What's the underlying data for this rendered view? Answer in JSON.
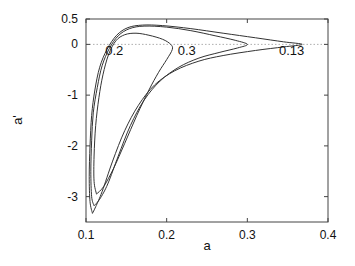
{
  "chart_data": {
    "type": "line",
    "title": "",
    "xlabel": "a",
    "ylabel": "a'",
    "xlim": [
      0.1,
      0.4
    ],
    "ylim": [
      -3.5,
      0.5
    ],
    "xticks": [
      0.1,
      0.2,
      0.3,
      0.4
    ],
    "xtick_labels": [
      "0.1",
      "0.2",
      "0.3",
      "0.4"
    ],
    "yticks": [
      0.5,
      0,
      -1,
      -2,
      -3
    ],
    "ytick_labels": [
      "0.5",
      "0",
      "-1",
      "-2",
      "-3"
    ],
    "grid": false,
    "reference_line": {
      "y": 0,
      "style": "dotted"
    },
    "legend": "none",
    "series": [
      {
        "name": "0.13",
        "label": "0.13",
        "label_at": [
          0.355,
          -0.12
        ],
        "closed": true,
        "points": [
          [
            0.108,
            -3.33
          ],
          [
            0.105,
            -3.1
          ],
          [
            0.104,
            -2.6
          ],
          [
            0.105,
            -2.0
          ],
          [
            0.107,
            -1.4
          ],
          [
            0.111,
            -0.9
          ],
          [
            0.117,
            -0.45
          ],
          [
            0.126,
            -0.1
          ],
          [
            0.138,
            0.18
          ],
          [
            0.152,
            0.33
          ],
          [
            0.17,
            0.38
          ],
          [
            0.195,
            0.37
          ],
          [
            0.23,
            0.31
          ],
          [
            0.27,
            0.22
          ],
          [
            0.31,
            0.13
          ],
          [
            0.345,
            0.05
          ],
          [
            0.368,
            0.0
          ],
          [
            0.345,
            -0.05
          ],
          [
            0.31,
            -0.12
          ],
          [
            0.27,
            -0.22
          ],
          [
            0.24,
            -0.33
          ],
          [
            0.21,
            -0.52
          ],
          [
            0.185,
            -0.8
          ],
          [
            0.165,
            -1.2
          ],
          [
            0.148,
            -1.7
          ],
          [
            0.133,
            -2.3
          ],
          [
            0.12,
            -2.9
          ],
          [
            0.112,
            -3.2
          ],
          [
            0.108,
            -3.33
          ]
        ]
      },
      {
        "name": "0.3",
        "label": "0.3",
        "label_at": [
          0.225,
          -0.12
        ],
        "closed": true,
        "points": [
          [
            0.11,
            -3.18
          ],
          [
            0.107,
            -3.0
          ],
          [
            0.106,
            -2.5
          ],
          [
            0.107,
            -1.9
          ],
          [
            0.109,
            -1.35
          ],
          [
            0.114,
            -0.85
          ],
          [
            0.12,
            -0.42
          ],
          [
            0.129,
            -0.08
          ],
          [
            0.14,
            0.17
          ],
          [
            0.154,
            0.31
          ],
          [
            0.172,
            0.36
          ],
          [
            0.2,
            0.34
          ],
          [
            0.23,
            0.27
          ],
          [
            0.26,
            0.17
          ],
          [
            0.285,
            0.08
          ],
          [
            0.3,
            0.0
          ],
          [
            0.288,
            -0.07
          ],
          [
            0.265,
            -0.16
          ],
          [
            0.24,
            -0.27
          ],
          [
            0.215,
            -0.45
          ],
          [
            0.192,
            -0.72
          ],
          [
            0.172,
            -1.1
          ],
          [
            0.155,
            -1.6
          ],
          [
            0.14,
            -2.2
          ],
          [
            0.127,
            -2.75
          ],
          [
            0.117,
            -3.05
          ],
          [
            0.11,
            -3.18
          ]
        ]
      },
      {
        "name": "0.2",
        "label": "0.2",
        "label_at": [
          0.135,
          -0.12
        ],
        "closed": true,
        "points": [
          [
            0.113,
            -2.95
          ],
          [
            0.11,
            -2.7
          ],
          [
            0.11,
            -2.2
          ],
          [
            0.112,
            -1.6
          ],
          [
            0.116,
            -1.05
          ],
          [
            0.121,
            -0.6
          ],
          [
            0.128,
            -0.2
          ],
          [
            0.137,
            0.07
          ],
          [
            0.148,
            0.19
          ],
          [
            0.162,
            0.22
          ],
          [
            0.178,
            0.18
          ],
          [
            0.195,
            0.1
          ],
          [
            0.205,
            0.0
          ],
          [
            0.207,
            -0.1
          ],
          [
            0.2,
            -0.3
          ],
          [
            0.19,
            -0.55
          ],
          [
            0.178,
            -0.9
          ],
          [
            0.163,
            -1.4
          ],
          [
            0.148,
            -1.95
          ],
          [
            0.134,
            -2.45
          ],
          [
            0.122,
            -2.8
          ],
          [
            0.113,
            -2.95
          ]
        ]
      }
    ]
  }
}
